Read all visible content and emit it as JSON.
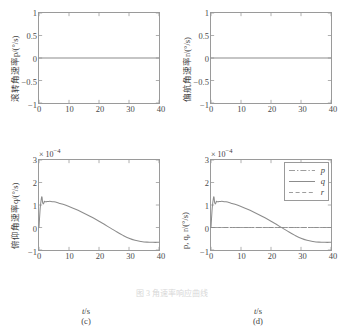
{
  "figure": {
    "caption": "图 3 角速率响应曲线",
    "background": "#ffffff",
    "axis_color": "#9a9a9a",
    "line_color": "#8c8c8c",
    "text_color": "#3d3d3d"
  },
  "chart_data": [
    {
      "type": "line",
      "panel": "(a)",
      "title": "",
      "xlabel": "t/s",
      "ylabel": "滚转角速率p/(°/s)",
      "ylabel_var": "p",
      "xlim": [
        0,
        40
      ],
      "ylim": [
        -1,
        1
      ],
      "xticks": [
        0,
        10,
        20,
        30,
        40
      ],
      "yticks": [
        -1,
        -0.5,
        0,
        0.5,
        1
      ],
      "xticklabels": [
        "0",
        "10",
        "20",
        "30",
        "40"
      ],
      "yticklabels": [
        "-1",
        "-0.5",
        "0",
        "0.5",
        "1"
      ],
      "exponent": "",
      "grid": false,
      "legend": null,
      "series": [
        {
          "name": "p",
          "style": "solid",
          "x": [
            0,
            4,
            8,
            12,
            16,
            20,
            24,
            28,
            32,
            36,
            40
          ],
          "values": [
            0,
            0,
            0,
            0,
            0,
            0,
            0,
            0,
            0,
            0,
            0
          ]
        }
      ]
    },
    {
      "type": "line",
      "panel": "(b)",
      "title": "",
      "xlabel": "t/s",
      "ylabel": "偏航角速率r/(°/s)",
      "ylabel_var": "r",
      "xlim": [
        0,
        40
      ],
      "ylim": [
        -1,
        1
      ],
      "xticks": [
        0,
        10,
        20,
        30,
        40
      ],
      "yticks": [
        -1,
        -0.5,
        0,
        0.5,
        1
      ],
      "xticklabels": [
        "0",
        "10",
        "20",
        "30",
        "40"
      ],
      "yticklabels": [
        "-1",
        "-0.5",
        "0",
        "0.5",
        "1"
      ],
      "exponent": "",
      "grid": false,
      "legend": null,
      "series": [
        {
          "name": "r",
          "style": "solid",
          "x": [
            0,
            4,
            8,
            12,
            16,
            20,
            24,
            28,
            32,
            36,
            40
          ],
          "values": [
            0,
            0,
            0,
            0,
            0,
            0,
            0,
            0,
            0,
            0,
            0
          ]
        }
      ]
    },
    {
      "type": "line",
      "panel": "(c)",
      "title": "",
      "xlabel": "t/s",
      "ylabel": "俯仰角速率q/(°/s)",
      "ylabel_var": "q",
      "xlim": [
        0,
        40
      ],
      "ylim": [
        -1,
        3
      ],
      "xticks": [
        0,
        10,
        20,
        30,
        40
      ],
      "yticks": [
        -1,
        0,
        1,
        2,
        3
      ],
      "xticklabels": [
        "0",
        "10",
        "20",
        "30",
        "40"
      ],
      "yticklabels": [
        "-1",
        "0",
        "1",
        "2",
        "3"
      ],
      "exponent": "× 10",
      "exponent_power": "-4",
      "grid": false,
      "legend": null,
      "series": [
        {
          "name": "q",
          "style": "solid",
          "x": [
            0,
            0.4,
            0.8,
            1.0,
            1.2,
            1.5,
            1.8,
            2.1,
            2.6,
            3.2,
            4.0,
            5.0,
            6.0,
            7.0,
            8.0,
            10.0,
            12.0,
            14.0,
            16.0,
            18.0,
            20.0,
            22.0,
            24.0,
            26.0,
            28.0,
            30.0,
            32.0,
            34.0,
            36.0,
            38.0,
            40.0
          ],
          "values": [
            0.0,
            0.85,
            1.3,
            1.35,
            1.12,
            1.05,
            1.16,
            1.14,
            1.15,
            1.16,
            1.16,
            1.14,
            1.11,
            1.07,
            1.03,
            0.93,
            0.82,
            0.7,
            0.57,
            0.43,
            0.28,
            0.12,
            -0.04,
            -0.2,
            -0.35,
            -0.48,
            -0.57,
            -0.62,
            -0.65,
            -0.66,
            -0.66
          ]
        }
      ]
    },
    {
      "type": "line",
      "panel": "(d)",
      "title": "",
      "xlabel": "t/s",
      "ylabel": "p, q, r/(°/s)",
      "ylabel_var": "p, q, r",
      "xlim": [
        0,
        40
      ],
      "ylim": [
        -1,
        3
      ],
      "xticks": [
        0,
        10,
        20,
        30,
        40
      ],
      "yticks": [
        -1,
        0,
        1,
        2,
        3
      ],
      "xticklabels": [
        "0",
        "10",
        "20",
        "30",
        "40"
      ],
      "yticklabels": [
        "-1",
        "0",
        "1",
        "2",
        "3"
      ],
      "exponent": "× 10",
      "exponent_power": "-4",
      "grid": false,
      "legend": {
        "position": "top-right",
        "entries": [
          {
            "label": "p",
            "style": "dashdot"
          },
          {
            "label": "q",
            "style": "solid"
          },
          {
            "label": "r",
            "style": "dashed"
          }
        ]
      },
      "series": [
        {
          "name": "p",
          "style": "dashdot",
          "x": [
            0,
            10,
            20,
            30,
            40
          ],
          "values": [
            0,
            0,
            0,
            0,
            0
          ]
        },
        {
          "name": "r",
          "style": "dashed",
          "x": [
            0,
            10,
            20,
            30,
            40
          ],
          "values": [
            0,
            0,
            0,
            0,
            0
          ]
        },
        {
          "name": "q",
          "style": "solid",
          "x": [
            0,
            0.4,
            0.8,
            1.0,
            1.2,
            1.5,
            1.8,
            2.1,
            2.6,
            3.2,
            4.0,
            5.0,
            6.0,
            7.0,
            8.0,
            10.0,
            12.0,
            14.0,
            16.0,
            18.0,
            20.0,
            22.0,
            24.0,
            26.0,
            28.0,
            30.0,
            32.0,
            34.0,
            36.0,
            38.0,
            40.0
          ],
          "values": [
            0.0,
            0.85,
            1.3,
            1.35,
            1.12,
            1.05,
            1.16,
            1.14,
            1.15,
            1.16,
            1.16,
            1.14,
            1.11,
            1.07,
            1.03,
            0.93,
            0.82,
            0.7,
            0.57,
            0.43,
            0.28,
            0.12,
            -0.04,
            -0.2,
            -0.35,
            -0.48,
            -0.57,
            -0.62,
            -0.65,
            -0.66,
            -0.66
          ]
        }
      ]
    }
  ]
}
